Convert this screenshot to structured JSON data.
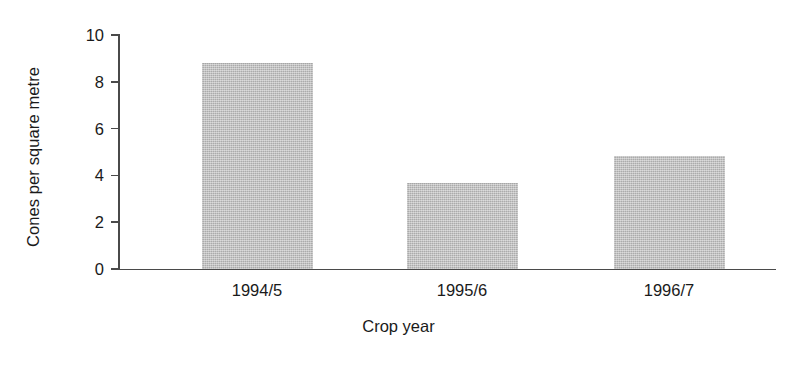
{
  "chart_data": {
    "type": "bar",
    "title": "",
    "subtitle": "",
    "xlabel": "Crop year",
    "ylabel": "Cones per square metre",
    "categories": [
      "1994/5",
      "1995/6",
      "1996/7"
    ],
    "values": [
      8.8,
      3.65,
      4.8
    ],
    "series": [
      {
        "name": "Cones per square metre",
        "values": [
          8.8,
          3.65,
          4.8
        ]
      }
    ],
    "ylim": [
      0,
      10
    ],
    "y_ticks": [
      0,
      2,
      4,
      6,
      8,
      10
    ],
    "y_tick_labels": [
      "0",
      "2",
      "4",
      "6",
      "8",
      "10"
    ],
    "grid": false,
    "legend": false,
    "legend_position": "none",
    "bar_color": "#bdbdbd",
    "axis_color": "#4a4a4a",
    "text_color": "#1a1a1a",
    "background_color": "#ffffff",
    "annotations": []
  },
  "axes": {
    "y_title": "Cones per square metre",
    "x_title": "Crop year"
  }
}
